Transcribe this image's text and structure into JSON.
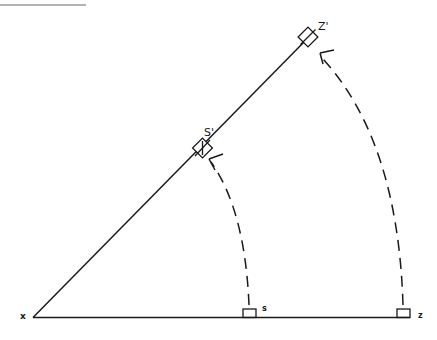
{
  "diagram": {
    "type": "geometric-rotation",
    "colors": {
      "stroke": "#1a1a1a",
      "rule": "#9a9a9a",
      "background": "#ffffff"
    },
    "labels": {
      "origin": "x",
      "s": "s",
      "z": "z",
      "s_prime": "S'",
      "z_prime": "Z'"
    },
    "elements": {
      "top_rule": "decorative top rule",
      "baseline": "horizontal line from x through s to z",
      "diagonal": "line from x through S' to Z'",
      "arc_s": "dashed arc from s to S' with arrowhead",
      "arc_z": "dashed arc from z to Z' with arrowhead"
    }
  }
}
